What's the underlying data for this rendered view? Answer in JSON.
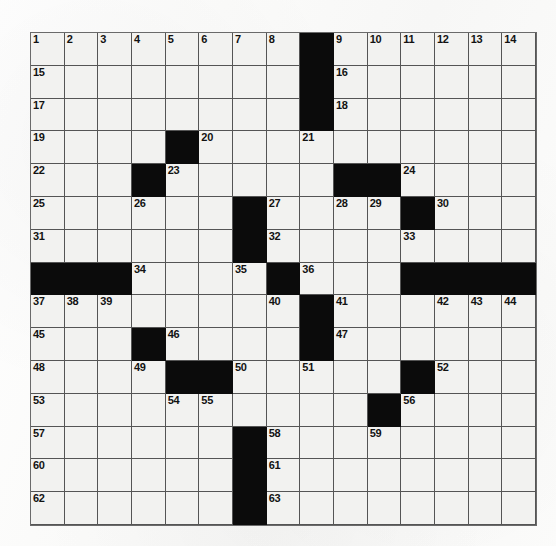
{
  "puzzle": {
    "type": "crossword-grid",
    "title": "",
    "rows": 15,
    "columns": 15,
    "colors": {
      "block": "#0b0b0b",
      "open_cell": "#f2f2f0",
      "grid_line": "#4a4a4a",
      "number_text": "#121212",
      "page_background": "#fdfdfc"
    },
    "highest_number": 63,
    "grid": [
      [
        {
          "block": false,
          "num": "1"
        },
        {
          "block": false,
          "num": "2"
        },
        {
          "block": false,
          "num": "3"
        },
        {
          "block": false,
          "num": "4"
        },
        {
          "block": false,
          "num": "5"
        },
        {
          "block": false,
          "num": "6"
        },
        {
          "block": false,
          "num": "7"
        },
        {
          "block": false,
          "num": "8"
        },
        {
          "block": true,
          "num": ""
        },
        {
          "block": false,
          "num": "9"
        },
        {
          "block": false,
          "num": "10"
        },
        {
          "block": false,
          "num": "11"
        },
        {
          "block": false,
          "num": "12"
        },
        {
          "block": false,
          "num": "13"
        },
        {
          "block": false,
          "num": "14"
        }
      ],
      [
        {
          "block": false,
          "num": "15"
        },
        {
          "block": false,
          "num": ""
        },
        {
          "block": false,
          "num": ""
        },
        {
          "block": false,
          "num": ""
        },
        {
          "block": false,
          "num": ""
        },
        {
          "block": false,
          "num": ""
        },
        {
          "block": false,
          "num": ""
        },
        {
          "block": false,
          "num": ""
        },
        {
          "block": true,
          "num": ""
        },
        {
          "block": false,
          "num": "16"
        },
        {
          "block": false,
          "num": ""
        },
        {
          "block": false,
          "num": ""
        },
        {
          "block": false,
          "num": ""
        },
        {
          "block": false,
          "num": ""
        },
        {
          "block": false,
          "num": ""
        }
      ],
      [
        {
          "block": false,
          "num": "17"
        },
        {
          "block": false,
          "num": ""
        },
        {
          "block": false,
          "num": ""
        },
        {
          "block": false,
          "num": ""
        },
        {
          "block": false,
          "num": ""
        },
        {
          "block": false,
          "num": ""
        },
        {
          "block": false,
          "num": ""
        },
        {
          "block": false,
          "num": ""
        },
        {
          "block": true,
          "num": ""
        },
        {
          "block": false,
          "num": "18"
        },
        {
          "block": false,
          "num": ""
        },
        {
          "block": false,
          "num": ""
        },
        {
          "block": false,
          "num": ""
        },
        {
          "block": false,
          "num": ""
        },
        {
          "block": false,
          "num": ""
        }
      ],
      [
        {
          "block": false,
          "num": "19"
        },
        {
          "block": false,
          "num": ""
        },
        {
          "block": false,
          "num": ""
        },
        {
          "block": false,
          "num": ""
        },
        {
          "block": true,
          "num": ""
        },
        {
          "block": false,
          "num": "20"
        },
        {
          "block": false,
          "num": ""
        },
        {
          "block": false,
          "num": ""
        },
        {
          "block": false,
          "num": "21"
        },
        {
          "block": false,
          "num": ""
        },
        {
          "block": false,
          "num": ""
        },
        {
          "block": false,
          "num": ""
        },
        {
          "block": false,
          "num": ""
        },
        {
          "block": false,
          "num": ""
        },
        {
          "block": false,
          "num": ""
        }
      ],
      [
        {
          "block": false,
          "num": "22"
        },
        {
          "block": false,
          "num": ""
        },
        {
          "block": false,
          "num": ""
        },
        {
          "block": true,
          "num": ""
        },
        {
          "block": false,
          "num": "23"
        },
        {
          "block": false,
          "num": ""
        },
        {
          "block": false,
          "num": ""
        },
        {
          "block": false,
          "num": ""
        },
        {
          "block": false,
          "num": ""
        },
        {
          "block": true,
          "num": ""
        },
        {
          "block": true,
          "num": ""
        },
        {
          "block": false,
          "num": "24"
        },
        {
          "block": false,
          "num": ""
        },
        {
          "block": false,
          "num": ""
        },
        {
          "block": false,
          "num": ""
        }
      ],
      [
        {
          "block": false,
          "num": "25"
        },
        {
          "block": false,
          "num": ""
        },
        {
          "block": false,
          "num": ""
        },
        {
          "block": false,
          "num": "26"
        },
        {
          "block": false,
          "num": ""
        },
        {
          "block": false,
          "num": ""
        },
        {
          "block": true,
          "num": ""
        },
        {
          "block": false,
          "num": "27"
        },
        {
          "block": false,
          "num": ""
        },
        {
          "block": false,
          "num": "28"
        },
        {
          "block": false,
          "num": "29"
        },
        {
          "block": true,
          "num": ""
        },
        {
          "block": false,
          "num": "30"
        },
        {
          "block": false,
          "num": ""
        },
        {
          "block": false,
          "num": ""
        }
      ],
      [
        {
          "block": false,
          "num": "31"
        },
        {
          "block": false,
          "num": ""
        },
        {
          "block": false,
          "num": ""
        },
        {
          "block": false,
          "num": ""
        },
        {
          "block": false,
          "num": ""
        },
        {
          "block": false,
          "num": ""
        },
        {
          "block": true,
          "num": ""
        },
        {
          "block": false,
          "num": "32"
        },
        {
          "block": false,
          "num": ""
        },
        {
          "block": false,
          "num": ""
        },
        {
          "block": false,
          "num": ""
        },
        {
          "block": false,
          "num": "33"
        },
        {
          "block": false,
          "num": ""
        },
        {
          "block": false,
          "num": ""
        },
        {
          "block": false,
          "num": ""
        }
      ],
      [
        {
          "block": true,
          "num": ""
        },
        {
          "block": true,
          "num": ""
        },
        {
          "block": true,
          "num": ""
        },
        {
          "block": false,
          "num": "34"
        },
        {
          "block": false,
          "num": ""
        },
        {
          "block": false,
          "num": ""
        },
        {
          "block": false,
          "num": "35"
        },
        {
          "block": true,
          "num": ""
        },
        {
          "block": false,
          "num": "36"
        },
        {
          "block": false,
          "num": ""
        },
        {
          "block": false,
          "num": ""
        },
        {
          "block": true,
          "num": ""
        },
        {
          "block": true,
          "num": ""
        },
        {
          "block": true,
          "num": ""
        },
        {
          "block": true,
          "num": ""
        }
      ],
      [
        {
          "block": false,
          "num": "37"
        },
        {
          "block": false,
          "num": "38"
        },
        {
          "block": false,
          "num": "39"
        },
        {
          "block": false,
          "num": ""
        },
        {
          "block": false,
          "num": ""
        },
        {
          "block": false,
          "num": ""
        },
        {
          "block": false,
          "num": ""
        },
        {
          "block": false,
          "num": "40"
        },
        {
          "block": true,
          "num": ""
        },
        {
          "block": false,
          "num": "41"
        },
        {
          "block": false,
          "num": ""
        },
        {
          "block": false,
          "num": ""
        },
        {
          "block": false,
          "num": "42"
        },
        {
          "block": false,
          "num": "43"
        },
        {
          "block": false,
          "num": "44"
        }
      ],
      [
        {
          "block": false,
          "num": "45"
        },
        {
          "block": false,
          "num": ""
        },
        {
          "block": false,
          "num": ""
        },
        {
          "block": true,
          "num": ""
        },
        {
          "block": false,
          "num": "46"
        },
        {
          "block": false,
          "num": ""
        },
        {
          "block": false,
          "num": ""
        },
        {
          "block": false,
          "num": ""
        },
        {
          "block": true,
          "num": ""
        },
        {
          "block": false,
          "num": "47"
        },
        {
          "block": false,
          "num": ""
        },
        {
          "block": false,
          "num": ""
        },
        {
          "block": false,
          "num": ""
        },
        {
          "block": false,
          "num": ""
        },
        {
          "block": false,
          "num": ""
        }
      ],
      [
        {
          "block": false,
          "num": "48"
        },
        {
          "block": false,
          "num": ""
        },
        {
          "block": false,
          "num": ""
        },
        {
          "block": false,
          "num": "49"
        },
        {
          "block": true,
          "num": ""
        },
        {
          "block": true,
          "num": ""
        },
        {
          "block": false,
          "num": "50"
        },
        {
          "block": false,
          "num": ""
        },
        {
          "block": false,
          "num": "51"
        },
        {
          "block": false,
          "num": ""
        },
        {
          "block": false,
          "num": ""
        },
        {
          "block": true,
          "num": ""
        },
        {
          "block": false,
          "num": "52"
        },
        {
          "block": false,
          "num": ""
        },
        {
          "block": false,
          "num": ""
        }
      ],
      [
        {
          "block": false,
          "num": "53"
        },
        {
          "block": false,
          "num": ""
        },
        {
          "block": false,
          "num": ""
        },
        {
          "block": false,
          "num": ""
        },
        {
          "block": false,
          "num": "54"
        },
        {
          "block": false,
          "num": "55"
        },
        {
          "block": false,
          "num": ""
        },
        {
          "block": false,
          "num": ""
        },
        {
          "block": false,
          "num": ""
        },
        {
          "block": false,
          "num": ""
        },
        {
          "block": true,
          "num": ""
        },
        {
          "block": false,
          "num": "56"
        },
        {
          "block": false,
          "num": ""
        },
        {
          "block": false,
          "num": ""
        },
        {
          "block": false,
          "num": ""
        }
      ],
      [
        {
          "block": false,
          "num": "57"
        },
        {
          "block": false,
          "num": ""
        },
        {
          "block": false,
          "num": ""
        },
        {
          "block": false,
          "num": ""
        },
        {
          "block": false,
          "num": ""
        },
        {
          "block": false,
          "num": ""
        },
        {
          "block": true,
          "num": ""
        },
        {
          "block": false,
          "num": "58"
        },
        {
          "block": false,
          "num": ""
        },
        {
          "block": false,
          "num": ""
        },
        {
          "block": false,
          "num": "59"
        },
        {
          "block": false,
          "num": ""
        },
        {
          "block": false,
          "num": ""
        },
        {
          "block": false,
          "num": ""
        },
        {
          "block": false,
          "num": ""
        }
      ],
      [
        {
          "block": false,
          "num": "60"
        },
        {
          "block": false,
          "num": ""
        },
        {
          "block": false,
          "num": ""
        },
        {
          "block": false,
          "num": ""
        },
        {
          "block": false,
          "num": ""
        },
        {
          "block": false,
          "num": ""
        },
        {
          "block": true,
          "num": ""
        },
        {
          "block": false,
          "num": "61"
        },
        {
          "block": false,
          "num": ""
        },
        {
          "block": false,
          "num": ""
        },
        {
          "block": false,
          "num": ""
        },
        {
          "block": false,
          "num": ""
        },
        {
          "block": false,
          "num": ""
        },
        {
          "block": false,
          "num": ""
        },
        {
          "block": false,
          "num": ""
        }
      ],
      [
        {
          "block": false,
          "num": "62"
        },
        {
          "block": false,
          "num": ""
        },
        {
          "block": false,
          "num": ""
        },
        {
          "block": false,
          "num": ""
        },
        {
          "block": false,
          "num": ""
        },
        {
          "block": false,
          "num": ""
        },
        {
          "block": true,
          "num": ""
        },
        {
          "block": false,
          "num": "63"
        },
        {
          "block": false,
          "num": ""
        },
        {
          "block": false,
          "num": ""
        },
        {
          "block": false,
          "num": ""
        },
        {
          "block": false,
          "num": ""
        },
        {
          "block": false,
          "num": ""
        },
        {
          "block": false,
          "num": ""
        },
        {
          "block": false,
          "num": ""
        }
      ]
    ]
  }
}
